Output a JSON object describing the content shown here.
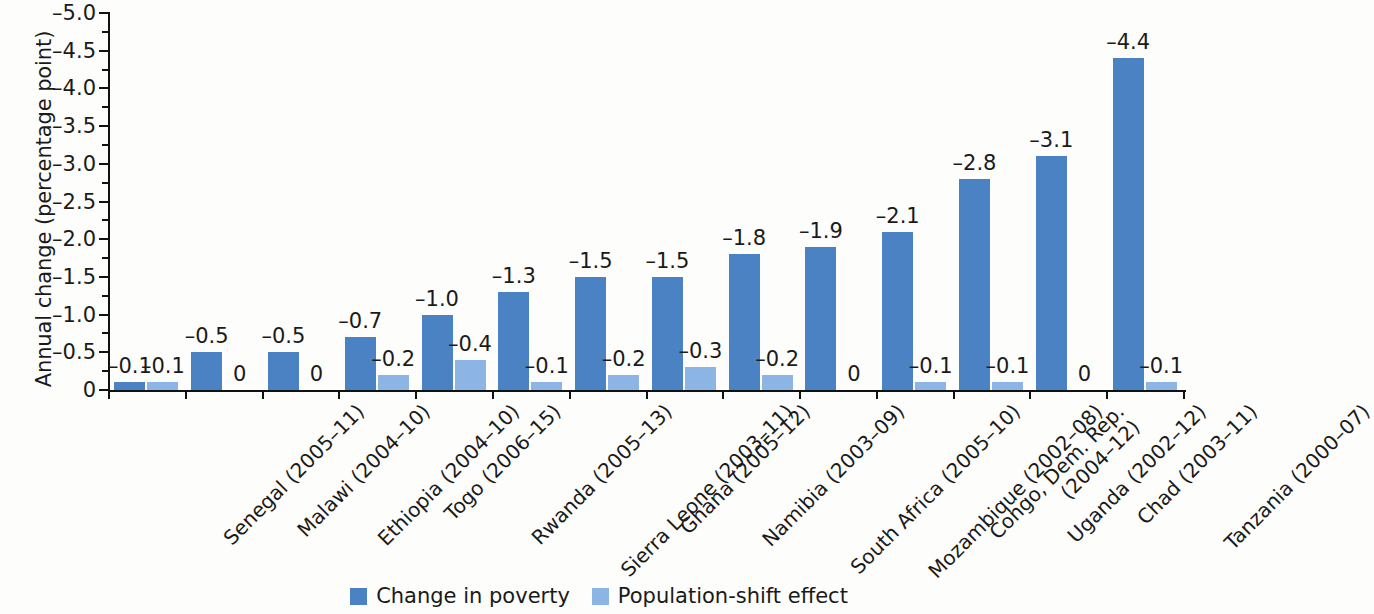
{
  "chart_data": {
    "type": "bar",
    "title": "",
    "xlabel": "",
    "ylabel": "Annual change (percentage point)",
    "ylim": [
      0,
      -5.0
    ],
    "y_major_ticks": [
      "0",
      "-0.5",
      "-1.0",
      "-1.5",
      "-2.0",
      "-2.5",
      "-3.0",
      "-3.5",
      "-4.0",
      "-4.5",
      "-5.0"
    ],
    "y_minor_ticks_between_majors": 1,
    "grid": false,
    "legend_position": "bottom-center",
    "orientation": "vertical-inverted",
    "categories": [
      "Senegal (2005–11)",
      "Malawi (2004–10)",
      "Ethiopia (2004–10)",
      "Togo (2006–15)",
      "Rwanda (2005–13)",
      "Sierra Leone (2003–11)",
      "Ghana (2005–12)",
      "Namibia (2003–09)",
      "South Africa (2005–10)",
      "Mozambique (2002–08)",
      "Congo, Dem. Rep.\n(2004–12)",
      "Uganda (2002–12)",
      "Chad (2003–11)",
      "Tanzania (2000–07)"
    ],
    "category_lines": [
      [
        "Senegal (2005–11)"
      ],
      [
        "Malawi (2004–10)"
      ],
      [
        "Ethiopia (2004–10)"
      ],
      [
        "Togo (2006–15)"
      ],
      [
        "Rwanda (2005–13)"
      ],
      [
        "Sierra Leone (2003–11)"
      ],
      [
        "Ghana (2005–12)"
      ],
      [
        "Namibia (2003–09)"
      ],
      [
        "South Africa (2005–10)"
      ],
      [
        "Mozambique (2002–08)"
      ],
      [
        "Congo, Dem. Rep.",
        "(2004–12)"
      ],
      [
        "Uganda (2002–12)"
      ],
      [
        "Chad (2003–11)"
      ],
      [
        "Tanzania (2000–07)"
      ]
    ],
    "series": [
      {
        "name": "Change in poverty",
        "color": "#4b82c4",
        "values": [
          -0.1,
          -0.5,
          -0.5,
          -0.7,
          -1.0,
          -1.3,
          -1.5,
          -1.5,
          -1.8,
          -1.9,
          -2.1,
          -2.8,
          -3.1,
          -4.4
        ],
        "labels": [
          "–0.1",
          "–0.5",
          "–0.5",
          "–0.7",
          "–1.0",
          "–1.3",
          "–1.5",
          "–1.5",
          "–1.8",
          "–1.9",
          "–2.1",
          "–2.8",
          "–3.1",
          "–4.4"
        ]
      },
      {
        "name": "Population-shift effect",
        "color": "#8cb4e4",
        "values": [
          -0.1,
          0,
          0,
          -0.2,
          -0.4,
          -0.1,
          -0.2,
          -0.3,
          -0.2,
          0,
          -0.1,
          -0.1,
          0,
          -0.1
        ],
        "labels": [
          "–0.1",
          "0",
          "0",
          "–0.2",
          "–0.4",
          "–0.1",
          "–0.2",
          "–0.3",
          "–0.2",
          "0",
          "–0.1",
          "–0.1",
          "0",
          "–0.1"
        ]
      }
    ]
  },
  "legend": {
    "items": [
      {
        "label": "Change in poverty",
        "color": "#4b82c4"
      },
      {
        "label": "Population-shift effect",
        "color": "#8cb4e4"
      }
    ]
  },
  "colors": {
    "background": "#fdfdfb",
    "axis": "#111111",
    "text": "#1a1a1a",
    "series_dark": "#4b82c4",
    "series_light": "#8cb4e4"
  }
}
